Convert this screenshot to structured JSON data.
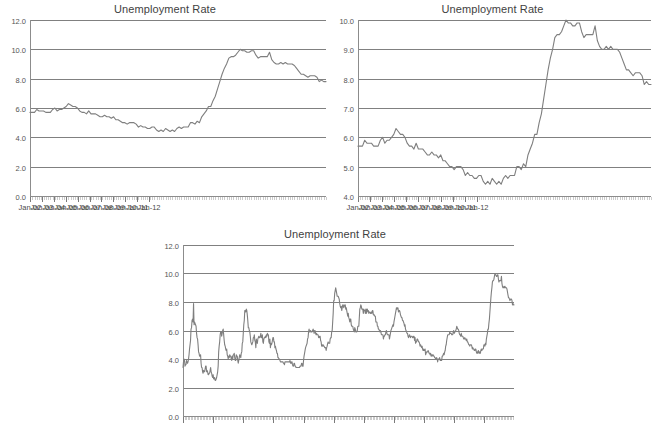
{
  "page": {
    "background": "#ffffff",
    "line_color": "#7f7f7f",
    "grid_color": "#808080",
    "text_color": "#3f3f3f"
  },
  "charts": [
    {
      "id": "chart-top-left",
      "title": "Unemployment Rate",
      "ylabel_values": [
        "12.0",
        "10.0",
        "8.0",
        "6.0",
        "4.0",
        "2.0",
        "0.0"
      ],
      "xlabel_values": [
        "Jan-02",
        "Jan-03",
        "Jan-04",
        "Jan-05",
        "Jan-06",
        "Jan-07",
        "Jan-08",
        "Jan-09",
        "Jan-10",
        "Jan-11",
        "Jan-12"
      ]
    },
    {
      "id": "chart-top-right",
      "title": "Unemployment Rate",
      "ylabel_values": [
        "10.0",
        "9.0",
        "8.0",
        "7.0",
        "6.0",
        "5.0",
        "4.0"
      ],
      "xlabel_values": [
        "Jan-02",
        "Jan-03",
        "Jan-04",
        "Jan-05",
        "Jan-06",
        "Jan-07",
        "Jan-08",
        "Jan-09",
        "Jan-10",
        "Jan-11",
        "Jan-12"
      ]
    },
    {
      "id": "chart-bottom",
      "title": "Unemployment Rate",
      "ylabel_values": [
        "12.0",
        "10.0",
        "8.0",
        "6.0",
        "4.0",
        "2.0",
        "0.0"
      ],
      "xlabel_values": []
    }
  ],
  "chart_data": [
    {
      "type": "line",
      "title": "Unemployment Rate",
      "xlabel": "",
      "ylabel": "",
      "ylim": [
        0.0,
        12.0
      ],
      "yticks": [
        0.0,
        2.0,
        4.0,
        6.0,
        8.0,
        10.0,
        12.0
      ],
      "grid": true,
      "legend": "none",
      "x_tick_labels": [
        "Jan-02",
        "Jan-03",
        "Jan-04",
        "Jan-05",
        "Jan-06",
        "Jan-07",
        "Jan-08",
        "Jan-09",
        "Jan-10",
        "Jan-11",
        "Jan-12"
      ],
      "x_start": "Jan-02",
      "x_end": "Dec-12",
      "series": [
        {
          "name": "Unemployment Rate",
          "values": [
            5.7,
            5.7,
            5.7,
            5.9,
            5.8,
            5.8,
            5.8,
            5.7,
            5.7,
            5.7,
            5.9,
            6.0,
            5.8,
            5.9,
            5.9,
            6.0,
            6.1,
            6.3,
            6.2,
            6.1,
            6.1,
            6.0,
            5.8,
            5.7,
            5.7,
            5.6,
            5.8,
            5.6,
            5.6,
            5.6,
            5.5,
            5.4,
            5.4,
            5.5,
            5.4,
            5.4,
            5.3,
            5.4,
            5.2,
            5.2,
            5.1,
            5.0,
            5.0,
            4.9,
            5.0,
            5.0,
            5.0,
            4.9,
            4.7,
            4.8,
            4.7,
            4.7,
            4.6,
            4.6,
            4.7,
            4.7,
            4.5,
            4.4,
            4.5,
            4.4,
            4.6,
            4.5,
            4.4,
            4.5,
            4.4,
            4.6,
            4.7,
            4.6,
            4.7,
            4.7,
            4.7,
            5.0,
            5.0,
            4.9,
            5.1,
            5.0,
            5.4,
            5.6,
            5.8,
            6.1,
            6.1,
            6.5,
            6.8,
            7.3,
            7.8,
            8.3,
            8.7,
            9.0,
            9.4,
            9.5,
            9.5,
            9.6,
            9.8,
            10.0,
            9.9,
            9.9,
            9.8,
            9.8,
            9.9,
            9.9,
            9.6,
            9.4,
            9.5,
            9.5,
            9.5,
            9.5,
            9.8,
            9.3,
            9.1,
            9.0,
            9.0,
            9.1,
            9.0,
            9.1,
            9.0,
            9.0,
            9.0,
            8.9,
            8.7,
            8.5,
            8.3,
            8.3,
            8.2,
            8.1,
            8.2,
            8.2,
            8.2,
            8.1,
            7.8,
            7.9,
            7.8,
            7.8
          ]
        }
      ]
    },
    {
      "type": "line",
      "title": "Unemployment Rate",
      "xlabel": "",
      "ylabel": "",
      "ylim": [
        4.0,
        10.0
      ],
      "yticks": [
        4.0,
        5.0,
        6.0,
        7.0,
        8.0,
        9.0,
        10.0
      ],
      "grid": true,
      "legend": "none",
      "note": "Same data as chart 1, y-axis truncated to 4.0-10.0 to exaggerate variation",
      "x_tick_labels": [
        "Jan-02",
        "Jan-03",
        "Jan-04",
        "Jan-05",
        "Jan-06",
        "Jan-07",
        "Jan-08",
        "Jan-09",
        "Jan-10",
        "Jan-11",
        "Jan-12"
      ],
      "x_start": "Jan-02",
      "x_end": "Dec-12",
      "series": [
        {
          "name": "Unemployment Rate",
          "values": [
            5.7,
            5.7,
            5.7,
            5.9,
            5.8,
            5.8,
            5.8,
            5.7,
            5.7,
            5.7,
            5.9,
            6.0,
            5.8,
            5.9,
            5.9,
            6.0,
            6.1,
            6.3,
            6.2,
            6.1,
            6.1,
            6.0,
            5.8,
            5.7,
            5.7,
            5.6,
            5.8,
            5.6,
            5.6,
            5.6,
            5.5,
            5.4,
            5.4,
            5.5,
            5.4,
            5.4,
            5.3,
            5.4,
            5.2,
            5.2,
            5.1,
            5.0,
            5.0,
            4.9,
            5.0,
            5.0,
            5.0,
            4.9,
            4.7,
            4.8,
            4.7,
            4.7,
            4.6,
            4.6,
            4.7,
            4.7,
            4.5,
            4.4,
            4.5,
            4.4,
            4.6,
            4.5,
            4.4,
            4.5,
            4.4,
            4.6,
            4.7,
            4.6,
            4.7,
            4.7,
            4.7,
            5.0,
            5.0,
            4.9,
            5.1,
            5.0,
            5.4,
            5.6,
            5.8,
            6.1,
            6.1,
            6.5,
            6.8,
            7.3,
            7.8,
            8.3,
            8.7,
            9.0,
            9.4,
            9.5,
            9.5,
            9.6,
            9.8,
            10.0,
            9.9,
            9.9,
            9.8,
            9.8,
            9.9,
            9.9,
            9.6,
            9.4,
            9.5,
            9.5,
            9.5,
            9.5,
            9.8,
            9.3,
            9.1,
            9.0,
            9.0,
            9.1,
            9.0,
            9.1,
            9.0,
            9.0,
            9.0,
            8.9,
            8.7,
            8.5,
            8.3,
            8.3,
            8.2,
            8.1,
            8.2,
            8.2,
            8.2,
            8.1,
            7.8,
            7.9,
            7.8,
            7.8
          ]
        }
      ]
    },
    {
      "type": "line",
      "title": "Unemployment Rate",
      "xlabel": "",
      "ylabel": "",
      "ylim": [
        0.0,
        12.0
      ],
      "yticks": [
        0.0,
        2.0,
        4.0,
        6.0,
        8.0,
        10.0,
        12.0
      ],
      "grid": true,
      "legend": "none",
      "note": "Long history series; x-axis tick labels are cut off at the bottom edge of the screenshot",
      "x_tick_labels": [],
      "x_start": "Jan-48",
      "x_end": "Dec-12",
      "series": [
        {
          "name": "Unemployment Rate",
          "values": [
            3.4,
            3.8,
            4.0,
            3.9,
            3.5,
            3.6,
            3.6,
            3.9,
            3.8,
            3.7,
            3.8,
            4.0,
            4.3,
            4.7,
            5.0,
            5.3,
            6.1,
            6.2,
            6.7,
            6.8,
            6.6,
            7.9,
            6.4,
            6.6,
            6.5,
            6.4,
            6.3,
            5.8,
            5.5,
            5.4,
            5.0,
            4.5,
            4.4,
            4.2,
            4.2,
            4.3,
            3.7,
            3.4,
            3.4,
            3.1,
            3.0,
            3.2,
            3.1,
            3.1,
            3.3,
            3.5,
            3.5,
            3.1,
            3.2,
            3.1,
            2.9,
            2.9,
            3.0,
            3.0,
            3.2,
            3.4,
            3.1,
            3.0,
            2.8,
            2.7,
            2.9,
            2.6,
            2.6,
            2.7,
            2.5,
            2.5,
            2.6,
            2.7,
            2.9,
            3.1,
            3.5,
            4.5,
            4.9,
            5.2,
            5.7,
            5.9,
            5.9,
            5.6,
            5.8,
            6.0,
            6.1,
            5.7,
            5.3,
            5.0,
            4.9,
            4.7,
            4.6,
            4.7,
            4.3,
            4.2,
            4.0,
            4.2,
            4.1,
            4.3,
            4.2,
            4.2,
            4.0,
            3.9,
            4.2,
            4.0,
            4.3,
            4.3,
            4.4,
            4.1,
            3.9,
            3.9,
            4.3,
            4.2,
            4.2,
            3.9,
            3.7,
            3.9,
            4.1,
            4.3,
            4.2,
            4.1,
            4.4,
            4.5,
            5.1,
            5.2,
            5.8,
            6.4,
            6.7,
            7.4,
            7.4,
            7.3,
            7.5,
            7.4,
            7.1,
            6.7,
            6.2,
            6.2,
            6.0,
            5.9,
            5.6,
            5.2,
            5.1,
            5.0,
            5.1,
            5.2,
            5.5,
            5.5,
            5.7,
            5.3,
            5.2,
            4.8,
            5.4,
            5.2,
            5.1,
            5.4,
            5.5,
            5.6,
            5.5,
            5.5,
            5.6,
            5.8,
            5.5,
            5.5,
            5.7,
            5.2,
            5.1,
            5.4,
            5.5,
            5.5,
            5.6,
            5.5,
            5.7,
            5.6,
            5.8,
            5.7,
            5.7,
            5.2,
            5.1,
            5.4,
            4.8,
            5.1,
            5.0,
            5.1,
            5.3,
            5.5,
            5.5,
            5.2,
            5.2,
            4.8,
            4.9,
            4.7,
            4.6,
            4.4,
            4.4,
            4.1,
            4.1,
            4.0,
            4.0,
            3.9,
            3.8,
            3.8,
            3.8,
            3.8,
            3.8,
            3.8,
            3.7,
            3.7,
            3.6,
            3.8,
            3.8,
            3.8,
            3.8,
            3.8,
            3.8,
            3.8,
            3.8,
            3.8,
            3.8,
            3.9,
            3.7,
            3.8,
            3.7,
            3.8,
            3.6,
            3.5,
            3.5,
            3.7,
            3.7,
            3.5,
            3.5,
            3.4,
            3.4,
            3.4,
            3.4,
            3.4,
            3.4,
            3.4,
            3.4,
            3.5,
            3.5,
            3.5,
            3.7,
            3.7,
            3.5,
            3.5,
            3.9,
            4.2,
            4.4,
            4.6,
            4.8,
            4.9,
            5.0,
            5.1,
            5.4,
            5.5,
            5.9,
            6.1,
            5.9,
            5.9,
            6.0,
            5.9,
            5.9,
            5.9,
            6.0,
            6.1,
            6.0,
            5.8,
            6.0,
            6.0,
            5.8,
            5.7,
            5.8,
            5.7,
            5.7,
            5.7,
            5.5,
            5.6,
            5.5,
            5.6,
            5.3,
            5.2,
            4.9,
            5.0,
            4.9,
            5.0,
            4.9,
            4.9,
            4.8,
            4.8,
            4.8,
            4.6,
            4.8,
            4.9,
            5.1,
            5.2,
            5.1,
            5.1,
            5.1,
            5.4,
            5.5,
            5.5,
            5.9,
            6.0,
            6.6,
            7.2,
            8.1,
            8.1,
            8.6,
            8.8,
            9.0,
            8.8,
            8.6,
            8.4,
            8.4,
            8.4,
            8.3,
            8.2,
            7.9,
            7.7,
            7.6,
            7.7,
            7.4,
            7.6,
            7.8,
            7.8,
            7.6,
            7.7,
            7.8,
            7.8,
            7.5,
            7.6,
            7.4,
            7.2,
            7.0,
            7.2,
            6.9,
            6.8,
            6.6,
            6.8,
            6.8,
            6.4,
            6.3,
            6.3,
            6.3,
            6.1,
            6.0,
            5.9,
            6.2,
            6.1,
            5.9,
            5.9,
            5.9,
            6.0,
            6.3,
            6.3,
            6.3,
            6.9,
            7.5,
            7.6,
            7.8,
            7.7,
            7.5,
            7.5,
            7.5,
            7.2,
            7.5,
            7.4,
            7.4,
            7.2,
            7.5,
            7.2,
            7.5,
            7.5,
            7.3,
            7.4,
            7.2,
            7.3,
            7.3,
            7.2,
            7.2,
            7.3,
            7.2,
            7.4,
            7.4,
            7.1,
            7.1,
            7.1,
            7.0,
            7.0,
            6.6,
            6.6,
            6.6,
            6.3,
            6.3,
            6.1,
            6.1,
            6.0,
            5.9,
            6.0,
            5.9,
            5.7,
            5.7,
            5.7,
            5.7,
            5.4,
            5.6,
            5.6,
            5.7,
            5.7,
            5.9,
            6.0,
            5.8,
            5.7,
            5.7,
            5.7,
            5.7,
            5.4,
            5.6,
            5.8,
            6.0,
            6.1,
            6.2,
            6.3,
            6.4,
            6.3,
            6.6,
            6.8,
            7.0,
            7.2,
            7.4,
            7.6,
            7.5,
            7.6,
            7.6,
            7.3,
            7.4,
            7.4,
            7.3,
            7.1,
            7.0,
            6.9,
            6.9,
            6.7,
            6.7,
            6.6,
            6.5,
            6.3,
            6.4,
            6.1,
            6.0,
            5.9,
            5.8,
            5.8,
            5.6,
            5.5,
            5.6,
            5.7,
            5.6,
            5.5,
            5.6,
            5.6,
            5.6,
            5.5,
            5.5,
            5.6,
            5.6,
            5.3,
            5.5,
            5.1,
            5.2,
            5.2,
            5.4,
            5.4,
            5.3,
            5.2,
            5.2,
            5.1,
            4.9,
            5.0,
            4.9,
            4.8,
            4.9,
            4.7,
            4.6,
            4.7,
            4.6,
            4.6,
            4.7,
            4.3,
            4.4,
            4.5,
            4.5,
            4.5,
            4.6,
            4.5,
            4.4,
            4.4,
            4.3,
            4.4,
            4.2,
            4.3,
            4.2,
            4.3,
            4.3,
            4.2,
            4.2,
            4.1,
            4.1,
            4.0,
            4.0,
            4.1,
            4.0,
            3.8,
            4.0,
            4.0,
            4.0,
            4.1,
            3.9,
            3.9,
            3.9,
            3.9,
            4.2,
            4.2,
            4.3,
            4.4,
            4.3,
            4.5,
            4.6,
            4.9,
            5.0,
            5.3,
            5.5,
            5.7,
            5.7,
            5.7,
            5.7,
            5.9,
            5.8,
            5.8,
            5.8,
            5.7,
            5.7,
            5.7,
            5.9,
            6.0,
            5.8,
            5.9,
            5.9,
            6.0,
            6.1,
            6.3,
            6.2,
            6.1,
            6.1,
            6.0,
            5.8,
            5.7,
            5.7,
            5.6,
            5.8,
            5.6,
            5.6,
            5.6,
            5.5,
            5.4,
            5.4,
            5.5,
            5.4,
            5.4,
            5.3,
            5.4,
            5.2,
            5.2,
            5.1,
            5.0,
            5.0,
            4.9,
            5.0,
            5.0,
            5.0,
            4.9,
            4.7,
            4.8,
            4.7,
            4.7,
            4.6,
            4.6,
            4.7,
            4.7,
            4.5,
            4.4,
            4.5,
            4.4,
            4.6,
            4.5,
            4.4,
            4.5,
            4.4,
            4.6,
            4.7,
            4.6,
            4.7,
            4.7,
            4.7,
            5.0,
            5.0,
            4.9,
            5.1,
            5.0,
            5.4,
            5.6,
            5.8,
            6.1,
            6.1,
            6.5,
            6.8,
            7.3,
            7.8,
            8.3,
            8.7,
            9.0,
            9.4,
            9.5,
            9.5,
            9.6,
            9.8,
            10.0,
            9.9,
            9.9,
            9.8,
            9.8,
            9.9,
            9.9,
            9.6,
            9.4,
            9.5,
            9.5,
            9.5,
            9.5,
            9.8,
            9.3,
            9.1,
            9.0,
            9.0,
            9.1,
            9.0,
            9.1,
            9.0,
            9.0,
            9.0,
            8.9,
            8.7,
            8.5,
            8.3,
            8.3,
            8.2,
            8.1,
            8.2,
            8.2,
            8.2,
            8.1,
            7.8,
            7.9,
            7.8,
            7.8
          ]
        }
      ]
    }
  ]
}
